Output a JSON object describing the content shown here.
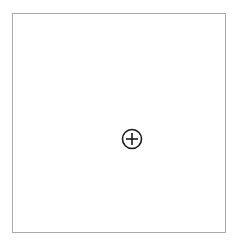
{
  "panel": {
    "border_color": "#a8a8a8",
    "background": "#ffffff",
    "add_button": {
      "icon": "circle-plus-icon",
      "label": "",
      "color": "#1a1a1a"
    }
  }
}
